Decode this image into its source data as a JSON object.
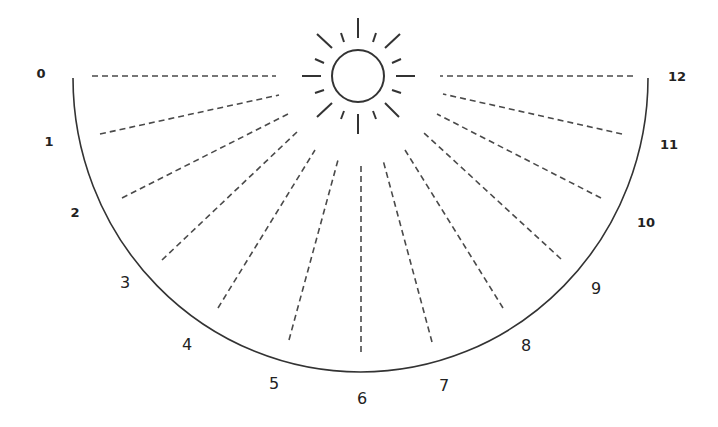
{
  "diagram": {
    "title": "",
    "type": "sundial-hour-scale",
    "colors": {
      "background": "#ffffff",
      "lines": "#4a4a4a",
      "arc": "#333333",
      "sun": "#333333",
      "labels": "#222222"
    },
    "sun": {
      "icon": "sun-icon",
      "center": [
        358,
        76
      ],
      "radius": 26,
      "rays": [
        [
          358,
          18,
          358,
          38
        ],
        [
          358,
          114,
          358,
          134
        ],
        [
          302,
          76,
          321,
          76
        ],
        [
          396,
          76,
          415,
          76
        ],
        [
          317,
          34,
          332,
          48
        ],
        [
          400,
          34,
          385,
          48
        ],
        [
          317,
          117,
          332,
          103
        ],
        [
          399,
          117,
          385,
          103
        ],
        [
          341,
          33,
          344,
          42
        ],
        [
          376,
          33,
          373,
          42
        ],
        [
          315,
          59,
          324,
          63
        ],
        [
          401,
          59,
          392,
          63
        ],
        [
          315,
          93,
          324,
          90
        ],
        [
          401,
          93,
          392,
          90
        ],
        [
          341,
          119,
          344,
          111
        ],
        [
          376,
          119,
          373,
          111
        ]
      ]
    },
    "arc": {
      "center": [
        360.5,
        78
      ],
      "rx": 287.5,
      "ry": 294
    },
    "hours": [
      {
        "label": "0",
        "x": 41,
        "y": 78,
        "size": "small",
        "line": [
          92,
          76,
          276,
          76
        ]
      },
      {
        "label": "1",
        "x": 49,
        "y": 146,
        "size": "small",
        "line": [
          100,
          134,
          279,
          95
        ]
      },
      {
        "label": "2",
        "x": 75,
        "y": 217,
        "size": "small",
        "line": [
          122,
          198,
          288,
          114
        ]
      },
      {
        "label": "3",
        "x": 125,
        "y": 288,
        "size": "large",
        "line": [
          162,
          260,
          297,
          132
        ]
      },
      {
        "label": "4",
        "x": 187,
        "y": 350,
        "size": "large",
        "line": [
          218,
          308,
          315,
          150
        ]
      },
      {
        "label": "5",
        "x": 274,
        "y": 389,
        "size": "large",
        "line": [
          289,
          340,
          338,
          160
        ]
      },
      {
        "label": "6",
        "x": 362,
        "y": 404,
        "size": "large",
        "line": [
          361,
          352,
          361,
          163
        ]
      },
      {
        "label": "7",
        "x": 444,
        "y": 391,
        "size": "large",
        "line": [
          432,
          342,
          383,
          160
        ]
      },
      {
        "label": "8",
        "x": 526,
        "y": 351,
        "size": "large",
        "line": [
          503,
          308,
          405,
          150
        ]
      },
      {
        "label": "9",
        "x": 596,
        "y": 294,
        "size": "large",
        "line": [
          561,
          259,
          424,
          133
        ]
      },
      {
        "label": "10",
        "x": 646,
        "y": 227,
        "size": "small",
        "line": [
          601,
          198,
          437,
          114
        ]
      },
      {
        "label": "11",
        "x": 669,
        "y": 149,
        "size": "small",
        "line": [
          622,
          134,
          443,
          94
        ]
      },
      {
        "label": "12",
        "x": 677,
        "y": 81,
        "size": "small",
        "line": [
          633,
          76,
          440,
          76
        ]
      }
    ]
  }
}
